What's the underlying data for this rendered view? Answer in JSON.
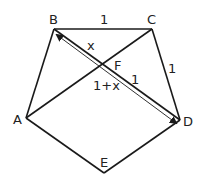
{
  "diagram": {
    "vertices": {
      "A": {
        "label": "A",
        "x": 26,
        "y": 118
      },
      "B": {
        "label": "B",
        "x": 54,
        "y": 29
      },
      "C": {
        "label": "C",
        "x": 152,
        "y": 29
      },
      "D": {
        "label": "D",
        "x": 180,
        "y": 120
      },
      "E": {
        "label": "E",
        "x": 104,
        "y": 173
      }
    },
    "intersection": {
      "label": "F",
      "x": 100,
      "y": 63
    },
    "edge_labels": {
      "BC": "1",
      "CD": "1",
      "BF": "x",
      "FD": "1",
      "BD_arrow": "1+x"
    },
    "line_color": "#1a1a1a"
  }
}
